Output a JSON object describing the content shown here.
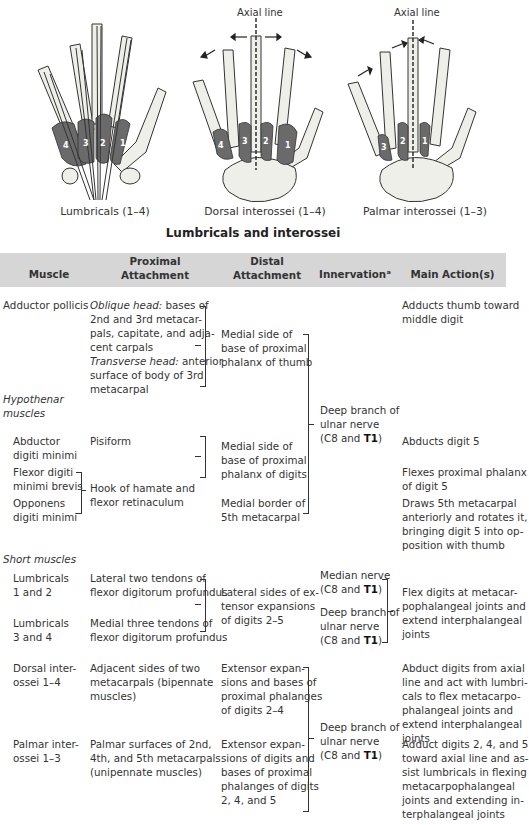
{
  "figure": {
    "title": "Lumbricals and interossei",
    "panels": [
      {
        "caption": "Lumbricals (1–4)",
        "muscle_labels": [
          "4",
          "3",
          "2",
          "1"
        ]
      },
      {
        "caption": "Dorsal interossei (1–4)",
        "axis_label": "Axial line",
        "muscle_labels": [
          "4",
          "3",
          "2",
          "1"
        ]
      },
      {
        "caption": "Palmar interossei (1–3)",
        "axis_label": "Axial line",
        "muscle_labels": [
          "3",
          "2",
          "1"
        ]
      }
    ],
    "colors": {
      "bone": "#efefe9",
      "muscle": "#6a6a6a",
      "outline": "#333333",
      "joint": "#a8a8a0"
    }
  },
  "table": {
    "header_bg": "#d6d6d6",
    "columns": [
      "Muscle",
      "Proximal\nAttachment",
      "Distal\nAttachment",
      "Innervationᵃ",
      "Main Action(s)"
    ],
    "rows": {
      "adductor_pollicis": {
        "muscle": "Adductor pollicis",
        "proximal_oblique_label": "Oblique head:",
        "proximal_oblique": " bases of\n2nd and 3rd metacar-\npals, capitate, and adja-\ncent carpals",
        "proximal_transverse_label": "Transverse head:",
        "proximal_transverse": " anterior\nsurface of body of 3rd\nmetacarpal",
        "distal": "Medial side of\nbase of proximal\nphalanx of thumb",
        "action": "Adducts thumb toward\nmiddle digit"
      },
      "hypothenar_group": "Hypothenar\nmuscles",
      "hypothenar_innervation_pre": "Deep branch of\nulnar nerve\n(C8 and ",
      "hypothenar_innervation_bold": "T1",
      "abductor_digiti_minimi": {
        "muscle": "Abductor\ndigiti minimi",
        "proximal": "Pisiform",
        "action": "Abducts digit 5"
      },
      "flexor_digiti_minimi": {
        "muscle": "Flexor digiti\nminimi brevis",
        "action": "Flexes proximal phalanx\nof digit 5"
      },
      "opponens_digiti_minimi": {
        "muscle": "Opponens\ndigiti minimi",
        "distal": "Medial border of\n5th metacarpal",
        "action": "Draws 5th metacarpal\nanteriorly and rotates it,\nbringing digit 5 into op-\nposition with thumb"
      },
      "hypothenar_shared_proximal": "Hook of hamate and\nflexor retinaculum",
      "hypothenar_shared_distal": "Medial side of\nbase of proximal\nphalanx of digits",
      "short_group": "Short muscles",
      "lumbricals_1_2": {
        "muscle": "Lumbricals\n1 and 2",
        "proximal": "Lateral two tendons of\nflexor digitorum profundus",
        "innervation_pre": "Median nerve\n(C8 and ",
        "innervation_bold": "T1"
      },
      "lumbricals_3_4": {
        "muscle": "Lumbricals\n3 and 4",
        "proximal": "Medial three tendons of\nflexor digitorum profundus",
        "innervation_pre": "Deep branch of\nulnar nerve\n(C8 and ",
        "innervation_bold": "T1"
      },
      "lumbricals_distal": "Lateral sides of ex-\ntensor expansions\nof digits 2–5",
      "lumbricals_action": "Flex digits at metacar-\npophalangeal joints and\nextend interphalangeal\njoints",
      "dorsal_interossei": {
        "muscle": "Dorsal inter-\nossei 1–4",
        "proximal": "Adjacent sides of two\nmetacarpals (bipennate\nmuscles)",
        "distal": "Extensor expan-\nsions and bases of\nproximal phalanges\nof digits 2–4",
        "action": "Abduct digits from axial\nline and act with lumbri-\ncals to flex metacarpo-\nphalangeal joints and\nextend interphalangeal\njoints"
      },
      "palmar_interossei": {
        "muscle": "Palmar inter-\nossei 1–3",
        "proximal": "Palmar surfaces of 2nd,\n4th, and 5th metacarpals\n(unipennate muscles)",
        "distal": "Extensor expan-\nsions of digits and\nbases of proximal\nphalanges of digits\n2, 4, and 5",
        "action": "Adduct digits 2, 4, and 5\ntoward axial line and as-\nsist lumbricals in flexing\nmetacarpophalangeal\njoints and extending in-\nterphalangeal joints"
      },
      "interossei_innervation_pre": "Deep branch of\nulnar nerve\n(C8 and ",
      "interossei_innervation_bold": "T1"
    }
  }
}
